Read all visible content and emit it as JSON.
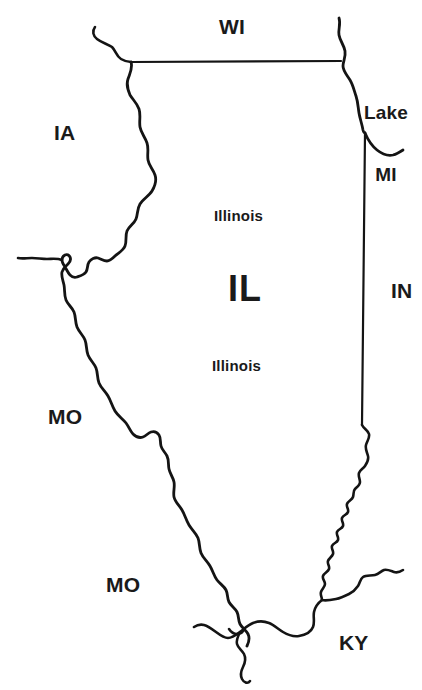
{
  "map": {
    "title": "Illinois state outline map",
    "focus_state": {
      "abbr": "IL",
      "name": "Illinois",
      "name_repeat": "Illinois"
    },
    "stroke_color": "#141414",
    "fill_color": "#ffffff",
    "background_color": "#ffffff",
    "labels": [
      {
        "id": "wi",
        "text": "WI",
        "x": 219,
        "y": 16,
        "kind": "state-abbr"
      },
      {
        "id": "lake-mi",
        "line1": "Lake",
        "line2": "MI",
        "x": 358,
        "y": 62,
        "kind": "lake"
      },
      {
        "id": "ia",
        "text": "IA",
        "x": 54,
        "y": 122,
        "kind": "state-abbr"
      },
      {
        "id": "illinois-north",
        "text": "Illinois",
        "x": 214,
        "y": 208,
        "kind": "state-name"
      },
      {
        "id": "il",
        "text": "IL",
        "x": 228,
        "y": 270,
        "kind": "focus"
      },
      {
        "id": "in",
        "text": "IN",
        "x": 391,
        "y": 280,
        "kind": "state-abbr"
      },
      {
        "id": "illinois-south",
        "text": "Illinois",
        "x": 212,
        "y": 358,
        "kind": "state-name"
      },
      {
        "id": "mo-north",
        "text": "MO",
        "x": 48,
        "y": 406,
        "kind": "state-abbr"
      },
      {
        "id": "mo-south",
        "text": "MO",
        "x": 106,
        "y": 574,
        "kind": "state-abbr"
      },
      {
        "id": "ky",
        "text": "KY",
        "x": 339,
        "y": 632,
        "kind": "state-abbr"
      }
    ],
    "borders": [
      {
        "id": "wi-il-line",
        "name": "wisconsin-illinois-border",
        "type": "straight"
      },
      {
        "id": "mississippi-river",
        "name": "mississippi-river-western-border",
        "type": "river"
      },
      {
        "id": "lake-michigan-shore",
        "name": "lake-michigan-shoreline",
        "type": "shoreline"
      },
      {
        "id": "indiana-line",
        "name": "indiana-illinois-border",
        "type": "straight"
      },
      {
        "id": "wabash-river",
        "name": "wabash-river-southeastern-border",
        "type": "river"
      },
      {
        "id": "ohio-river",
        "name": "ohio-river-southern-border",
        "type": "river"
      },
      {
        "id": "des-moines-tributary",
        "name": "tributary-river-branch",
        "type": "river"
      }
    ]
  }
}
